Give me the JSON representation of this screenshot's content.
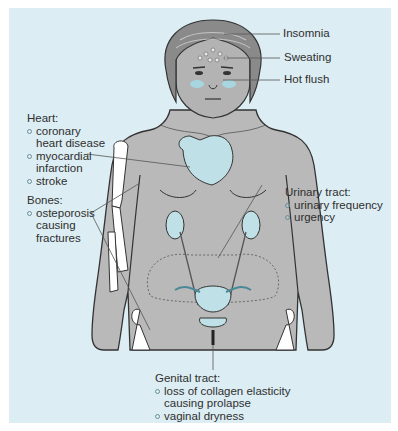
{
  "diagram": {
    "colors": {
      "background": "#dcedf3",
      "skin": "#b9b9b9",
      "hair": "#8a8a8a",
      "organ": "#bfe0e6",
      "bone": "#ffffff",
      "outline": "#333333",
      "leader": "#555555"
    },
    "head_labels": {
      "insomnia": "Insomnia",
      "sweating": "Sweating",
      "hot_flush": "Hot flush"
    },
    "heart": {
      "title": "Heart:",
      "items": [
        "coronary heart disease",
        "myocardial infarction",
        "stroke"
      ]
    },
    "bones": {
      "title": "Bones:",
      "items": [
        "osteporosis causing fractures"
      ]
    },
    "urinary": {
      "title": "Urinary tract:",
      "items": [
        "urinary frequency",
        "urgency"
      ]
    },
    "genital": {
      "title": "Genital tract:",
      "items": [
        "loss of collagen elasticity causing prolapse",
        "vaginal dryness"
      ]
    }
  }
}
